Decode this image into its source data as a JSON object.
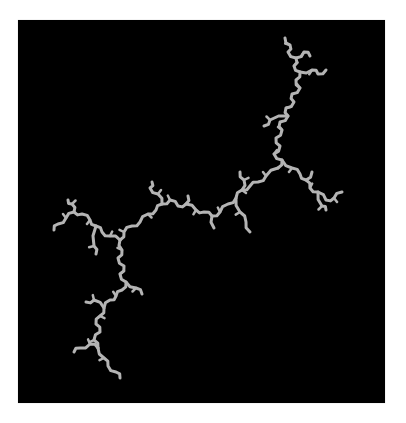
{
  "image": {
    "subject": "dendrite-fractal",
    "background_color": "#000000",
    "frame_color": "#ffffff",
    "stroke_color": "#b4b4b4",
    "stroke_width": 3
  },
  "skeleton": [
    {
      "name": "top-branch",
      "points": "285,38 290,45 288,52 296,58 294,66 300,72 296,80 300,88 292,94 294,102 286,108 288,116 280,122 282,130 276,138 280,146 274,154 282,160 278,168"
    },
    {
      "name": "top-side-1",
      "points": "296,58 304,52 310,56"
    },
    {
      "name": "top-side-2",
      "points": "300,72 312,70 318,74 326,70"
    },
    {
      "name": "top-side-3",
      "points": "288,116 270,120 264,126"
    },
    {
      "name": "right-branch",
      "points": "282,160 292,168 300,174 306,180 310,188 318,192 326,200 334,198 342,192"
    },
    {
      "name": "right-side-1",
      "points": "318,192 322,206 326,210"
    },
    {
      "name": "right-side-2",
      "points": "306,180 312,172"
    },
    {
      "name": "center-branch",
      "points": "278,168 266,176 258,182 250,186 242,190 236,198 228,204 220,212 212,216 204,212 196,210 186,204 178,206 170,200 162,204 156,210 148,214 140,222 132,226 124,232 120,240"
    },
    {
      "name": "center-side-1",
      "points": "242,190 244,180 240,172"
    },
    {
      "name": "center-side-2",
      "points": "236,198 240,212 246,222 250,232"
    },
    {
      "name": "center-side-3",
      "points": "212,216 214,228"
    },
    {
      "name": "center-side-4",
      "points": "162,204 158,194 150,188 152,182"
    },
    {
      "name": "center-side-5",
      "points": "186,204 188,196"
    },
    {
      "name": "left-branch",
      "points": "120,240 110,236 102,232 96,226 90,220 82,214 74,212 66,218 58,224 54,230"
    },
    {
      "name": "left-side-1",
      "points": "74,212 72,204 68,200"
    },
    {
      "name": "left-side-2",
      "points": "96,226 94,246 96,254"
    },
    {
      "name": "lower-branch",
      "points": "120,240 122,250 118,258 124,266 120,274 126,282 122,290 116,296 110,300 104,308 100,316 96,324 100,332 94,340 98,348"
    },
    {
      "name": "lower-side-1",
      "points": "126,282 136,288 142,294"
    },
    {
      "name": "lower-side-2",
      "points": "104,308 94,300 86,302"
    },
    {
      "name": "lower-tail",
      "points": "98,348 90,344 80,348 74,352"
    },
    {
      "name": "lower-tail-2",
      "points": "98,348 104,358 108,366 116,372 120,378"
    }
  ]
}
